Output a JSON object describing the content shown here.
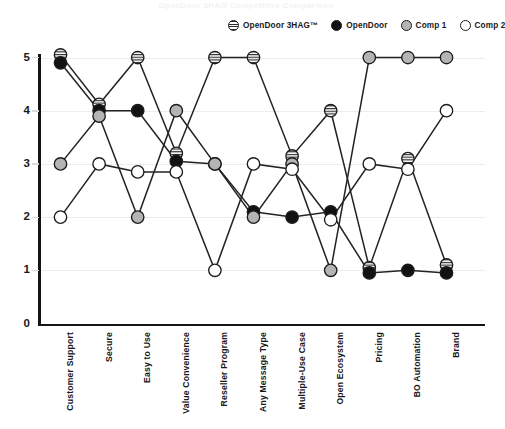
{
  "title": "OpenDoor 3HAG Competitive Comparison",
  "legend": {
    "position": "top-right",
    "items": [
      {
        "label": "OpenDoor 3HAG™",
        "style": "hatched-circle",
        "color": "#2a2a2c"
      },
      {
        "label": "OpenDoor",
        "style": "filled-circle",
        "color": "#121214"
      },
      {
        "label": "Comp 1",
        "style": "gray-circle",
        "color": "#b4b4b4"
      },
      {
        "label": "Comp 2",
        "style": "open-circle",
        "color": "#ffffff"
      }
    ]
  },
  "axes": {
    "y_ticks": [
      "5",
      "4",
      "3",
      "2",
      "1",
      "0"
    ],
    "x_labels": [
      "Customer Support",
      "Secure",
      "Easy to Use",
      "Value Convenience",
      "Reseller Program",
      "Any Message Type",
      "Multiple-Use Case",
      "Open Ecosystem",
      "Pricing",
      "BO Automation",
      "Brand"
    ]
  },
  "chart_data": {
    "type": "line",
    "title": "OpenDoor 3HAG Competitive Comparison",
    "xlabel": "",
    "ylabel": "",
    "ylim": [
      0,
      5
    ],
    "grid": true,
    "legend_position": "top-right",
    "categories": [
      "Customer Support",
      "Secure",
      "Easy to Use",
      "Value Convenience",
      "Reseller Program",
      "Any Message Type",
      "Multiple-Use Case",
      "Open Ecosystem",
      "Pricing",
      "BO Automation",
      "Brand"
    ],
    "series": [
      {
        "name": "OpenDoor 3HAG™",
        "marker": "hatched-circle",
        "color": "#2a2a2c",
        "values": [
          5.05,
          4.12,
          5.0,
          3.2,
          5.0,
          5.0,
          3.15,
          4.0,
          1.05,
          3.1,
          1.1
        ]
      },
      {
        "name": "OpenDoor",
        "marker": "filled-circle",
        "color": "#121214",
        "values": [
          4.9,
          4.0,
          4.0,
          3.05,
          3.0,
          2.1,
          2.0,
          2.1,
          0.95,
          1.0,
          0.95
        ]
      },
      {
        "name": "Comp 1",
        "marker": "gray-circle",
        "color": "#b4b4b4",
        "values": [
          3.0,
          3.9,
          2.0,
          4.0,
          3.0,
          2.0,
          3.0,
          1.0,
          5.0,
          5.0,
          5.0
        ]
      },
      {
        "name": "Comp 2",
        "marker": "open-circle",
        "color": "#ffffff",
        "values": [
          2.0,
          3.0,
          2.85,
          2.85,
          1.0,
          3.0,
          2.9,
          1.95,
          3.0,
          2.9,
          4.0
        ]
      }
    ]
  }
}
